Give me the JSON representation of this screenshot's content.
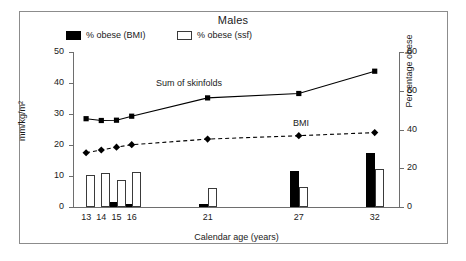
{
  "figure": {
    "title": "Males"
  },
  "legend": {
    "position": "top-left",
    "items": [
      {
        "label": "% obese (BMI)",
        "swatch": "filled-square",
        "color": "#000000"
      },
      {
        "label": "% obese (ssf)",
        "swatch": "open-square",
        "color": "#ffffff"
      }
    ]
  },
  "chart_data": {
    "type": "bar",
    "title": "Males",
    "xlabel": "Calendar age (years)",
    "ylabel": "mm/kg/m²",
    "y2label": "Percentage obese",
    "grid": false,
    "legend_position": "top-left",
    "categories": [
      "13",
      "14",
      "15",
      "16",
      "21",
      "27",
      "32"
    ],
    "x": [
      13,
      14,
      15,
      16,
      21,
      27,
      32
    ],
    "ylim": [
      0,
      50
    ],
    "yticks": [
      0,
      10,
      20,
      30,
      40,
      50
    ],
    "y2lim": [
      0,
      80
    ],
    "y2ticks": [
      0,
      20,
      40,
      60,
      80
    ],
    "series": [
      {
        "name": "Sum of skinfolds",
        "type": "line",
        "axis": "left",
        "marker": "square-filled",
        "linestyle": "solid",
        "color": "#000000",
        "values": [
          28.5,
          27.9,
          28.0,
          29.3,
          35.2,
          36.6,
          43.8
        ]
      },
      {
        "name": "BMI",
        "type": "line",
        "axis": "left",
        "marker": "diamond-filled",
        "linestyle": "dashed",
        "color": "#000000",
        "values": [
          17.5,
          18.4,
          19.3,
          20.1,
          21.9,
          23.0,
          24.0
        ]
      },
      {
        "name": "% obese (BMI)",
        "type": "bar",
        "axis": "right",
        "fill": "filled",
        "color": "#000000",
        "values": [
          0.0,
          0.0,
          2.4,
          1.3,
          1.5,
          18.5,
          28.0
        ]
      },
      {
        "name": "% obese (ssf)",
        "type": "bar",
        "axis": "right",
        "fill": "open",
        "color": "#ffffff",
        "values": [
          16.4,
          17.8,
          13.8,
          17.9,
          9.6,
          10.1,
          19.8
        ]
      }
    ],
    "annotations": [
      {
        "text": "Sum of skinfolds",
        "x": 16.6,
        "y": 41.0
      },
      {
        "text": "BMI",
        "x": 28.2,
        "y": 29.5
      }
    ]
  },
  "axes": {
    "left": {
      "label": "mm/kg/m²",
      "ticks": [
        "50",
        "40",
        "30",
        "20",
        "10",
        "0"
      ]
    },
    "right": {
      "label": "Percentage obese",
      "ticks": [
        "80",
        "60",
        "40",
        "20",
        "0"
      ]
    },
    "bottom": {
      "label": "Calendar age (years)",
      "ticks": [
        "13",
        "14",
        "15",
        "16",
        "21",
        "27",
        "32"
      ]
    }
  }
}
